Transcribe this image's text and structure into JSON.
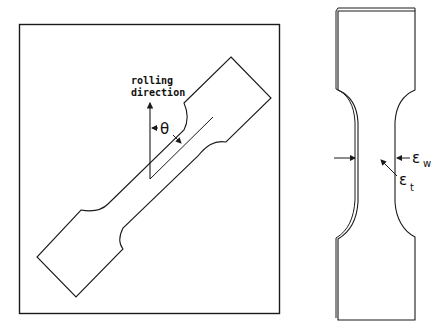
{
  "figure": {
    "left_panel": {
      "description": "Sheet with tensile specimen cut at angle to rolling direction",
      "labels": {
        "rolling_line1": "rolling",
        "rolling_line2": "direction",
        "angle": "θ"
      }
    },
    "right_panel": {
      "description": "Tensile specimen showing strain directions",
      "labels": {
        "width_strain_symbol": "ε",
        "width_strain_sub": "w",
        "thickness_strain_symbol": "ε",
        "thickness_strain_sub": "t"
      }
    },
    "colors": {
      "line": "#1a1a1a",
      "background": "#ffffff"
    }
  }
}
